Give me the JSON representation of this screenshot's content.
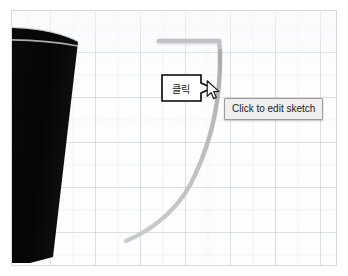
{
  "app": {
    "view_name": "3d-sketch-viewport"
  },
  "canvas": {
    "background_color": "#fdfdfd",
    "grid_color": "#aab2ba",
    "border_color": "#d9d9d9"
  },
  "geometry": {
    "solid_color": "#0b0b0b",
    "solid_name": "cone-solid",
    "sketch_color": "#b9bcbf",
    "sketch_name": "highlighted-sketch-curve"
  },
  "callout": {
    "text": "클릭",
    "fill_color": "#ffffff",
    "stroke_color": "#000000"
  },
  "tooltip": {
    "text": "Click to edit sketch",
    "background_color": "#efefef",
    "border_color": "#9a9a9a"
  },
  "cursor": {
    "icon": "arrow-pointer-icon"
  }
}
